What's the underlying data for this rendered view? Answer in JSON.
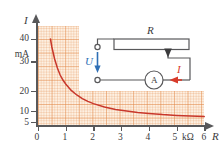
{
  "figure": {
    "kind": "physics-textbook-figure"
  },
  "chart_data": {
    "type": "line",
    "title": "",
    "xlabel": "R",
    "ylabel": "I",
    "x_unit": "kΩ",
    "y_unit": "mA",
    "xlim": [
      0,
      6
    ],
    "ylim": [
      5,
      46
    ],
    "grid": true,
    "legend": null,
    "y_axis_label": "I",
    "y_unit_label": "mA",
    "x_axis_label": "R",
    "x_unit_label": "kΩ",
    "x_ticks": [
      0,
      1,
      2,
      3,
      4,
      5,
      6
    ],
    "x_tick_labels": [
      "0",
      "1",
      "2",
      "3",
      "4",
      "5",
      "6"
    ],
    "y_ticks": [
      5,
      10,
      20,
      30,
      40
    ],
    "y_tick_labels": [
      "5",
      "10",
      "20",
      "30",
      "40"
    ],
    "series": [
      {
        "name": "I = U / R",
        "color": "#c8372b",
        "x": [
          0.45,
          0.5,
          0.6,
          0.7,
          0.8,
          0.9,
          1.0,
          1.2,
          1.4,
          1.6,
          1.8,
          2.0,
          2.4,
          2.8,
          3.2,
          3.6,
          4.0,
          4.5,
          5.0,
          5.5,
          6.0
        ],
        "y": [
          46.0,
          42.0,
          36.0,
          31.5,
          28.0,
          25.5,
          23.5,
          20.3,
          18.0,
          16.2,
          14.8,
          13.7,
          12.0,
          10.8,
          10.0,
          9.3,
          8.8,
          8.2,
          7.8,
          7.5,
          7.2
        ]
      }
    ]
  },
  "circuit": {
    "resistor_label": "R",
    "voltage_label": "U",
    "current_label": "I",
    "ammeter_label": "A",
    "current_color": "#d83a2a",
    "voltage_color": "#2f6fb5",
    "wire_color": "#58585a",
    "components": [
      "potentiometer-resistor",
      "wiper-tap",
      "supply-terminals",
      "ammeter",
      "current-arrow"
    ]
  },
  "colors": {
    "grid": "#e28746",
    "grid_fill": "#fdf0e2",
    "curve": "#c8372b",
    "axis": "#58585a",
    "text": "#3b3b3d"
  }
}
